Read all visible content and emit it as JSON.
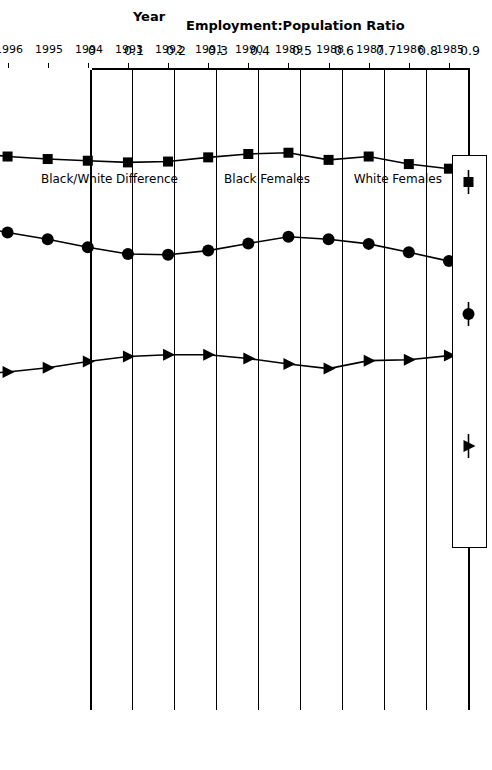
{
  "chart_data": {
    "type": "line",
    "title": "",
    "xlabel": "Year",
    "ylabel": "Employment:Population Ratio",
    "x": [
      1985,
      1986,
      1987,
      1988,
      1989,
      1990,
      1991,
      1992,
      1993,
      1994,
      1995,
      1996,
      1997,
      1998,
      1999,
      2000
    ],
    "xtick_labels": [
      "1985",
      "1986",
      "1987",
      "1988",
      "1989",
      "1990",
      "1991",
      "1992",
      "1993",
      "1994",
      "1995",
      "1996",
      "1997",
      "1998",
      "1999",
      "2000"
    ],
    "ytick_labels": [
      "0",
      "0.1",
      "0.2",
      "0.3",
      "0.4",
      "0.5",
      "0.6",
      "0.7",
      "0.8",
      "0.9"
    ],
    "yticks": [
      0,
      0.1,
      0.2,
      0.3,
      0.4,
      0.5,
      0.6,
      0.7,
      0.8,
      0.9
    ],
    "ylim": [
      0,
      0.9
    ],
    "grid": true,
    "legend_position": "bottom-right",
    "series": [
      {
        "name": "White Females",
        "marker": "square",
        "color": "#000000",
        "values": [
          0.665,
          0.676,
          0.694,
          0.686,
          0.703,
          0.7,
          0.692,
          0.682,
          0.68,
          0.684,
          0.688,
          0.694,
          0.706,
          0.7,
          0.691,
          0.682
        ]
      },
      {
        "name": "Black Females",
        "marker": "circle",
        "color": "#000000",
        "values": [
          0.445,
          0.466,
          0.486,
          0.497,
          0.503,
          0.487,
          0.47,
          0.46,
          0.462,
          0.478,
          0.497,
          0.513,
          0.532,
          0.556,
          0.545,
          0.58
        ]
      },
      {
        "name": "Black/White Difference",
        "marker": "triangle",
        "color": "#000000",
        "values": [
          0.22,
          0.21,
          0.208,
          0.189,
          0.2,
          0.213,
          0.222,
          0.222,
          0.218,
          0.206,
          0.191,
          0.181,
          0.174,
          0.144,
          0.146,
          0.102
        ]
      }
    ]
  },
  "legend": {
    "entries": [
      {
        "label": "White Females",
        "marker": "square"
      },
      {
        "label": "Black Females",
        "marker": "circle"
      },
      {
        "label": "Black/White Difference",
        "marker": "triangle"
      }
    ]
  }
}
